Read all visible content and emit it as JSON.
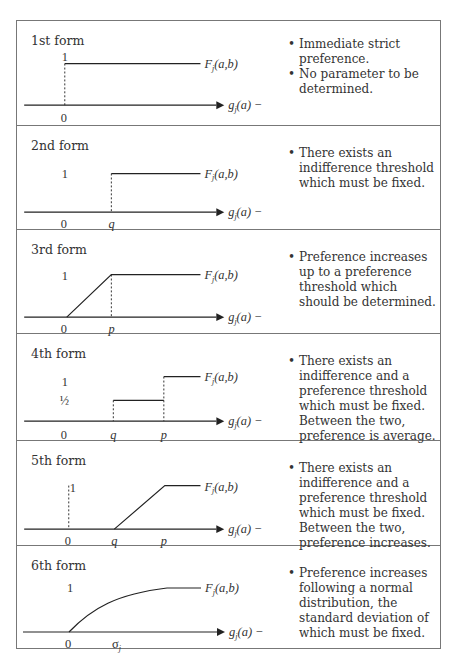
{
  "axis_labels": {
    "y_func": "F",
    "y_sub": "j",
    "y_args": "(a,b)",
    "x_func": "g",
    "x_sub": "j",
    "x_args": "(a) −"
  },
  "forms": [
    {
      "title": "1st form",
      "y_ticks": [
        "1"
      ],
      "x_ticks": [
        "0"
      ],
      "bullets": [
        "Immediate strict preference.",
        "No parameter to be determined."
      ]
    },
    {
      "title": "2nd form",
      "y_ticks": [
        "1"
      ],
      "x_ticks": [
        "0",
        "q"
      ],
      "bullets": [
        "There exists an indifference threshold which must be fixed."
      ]
    },
    {
      "title": "3rd form",
      "y_ticks": [
        "1"
      ],
      "x_ticks": [
        "0",
        "p"
      ],
      "bullets": [
        "Preference increases up to a preference threshold which should be determined."
      ]
    },
    {
      "title": "4th form",
      "y_ticks": [
        "1",
        "½"
      ],
      "x_ticks": [
        "0",
        "q",
        "p"
      ],
      "bullets": [
        "There exists an indifference and a preference threshold which must be fixed. Between the two, preference is average."
      ]
    },
    {
      "title": "5th form",
      "y_ticks": [
        "1"
      ],
      "x_ticks": [
        "0",
        "q",
        "p"
      ],
      "bullets": [
        "There exists an indifference and a preference threshold which must be fixed. Between the two, preference increases."
      ]
    },
    {
      "title": "6th form",
      "y_ticks": [
        "1"
      ],
      "x_ticks": [
        "0",
        "σ",
        "j"
      ],
      "bullets": [
        "Preference increases following a normal distribution, the standard deviation of which must be fixed."
      ]
    }
  ]
}
